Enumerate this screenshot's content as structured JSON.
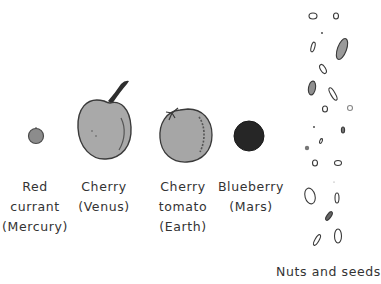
{
  "diagram": {
    "items": [
      {
        "id": "mercury",
        "lines": [
          "Red",
          "currant",
          "(Mercury)"
        ],
        "food": "Red currant",
        "planet": "Mercury",
        "shape": {
          "cx": 36,
          "cy": 136,
          "r": 7.5
        },
        "fill": "#8a8a8a"
      },
      {
        "id": "venus",
        "lines": [
          "Cherry",
          "(Venus)"
        ],
        "food": "Cherry",
        "planet": "Venus",
        "shape": {
          "cx": 104,
          "cy": 129,
          "rx": 28,
          "ry": 30
        },
        "fill": "#a9a9a9"
      },
      {
        "id": "earth",
        "lines": [
          "Cherry",
          "tomato",
          "(Earth)"
        ],
        "food": "Cherry tomato",
        "planet": "Earth",
        "shape": {
          "cx": 186,
          "cy": 136,
          "rx": 26,
          "ry": 27
        },
        "fill": "#a6a6a6"
      },
      {
        "id": "mars",
        "lines": [
          "Blueberry",
          "(Mars)"
        ],
        "food": "Blueberry",
        "planet": "Mars",
        "shape": {
          "cx": 249,
          "cy": 136,
          "r": 15
        },
        "fill": "#262626"
      },
      {
        "id": "asteroids",
        "lines": [
          "Nuts and seeds"
        ],
        "food": "Nuts and seeds",
        "planet": ""
      }
    ]
  },
  "colors": {
    "background": "#ffffff",
    "outline": "#3a3a3a",
    "light_fill": "#a8a8a8",
    "dark_fill": "#262626",
    "text": "#333333"
  }
}
